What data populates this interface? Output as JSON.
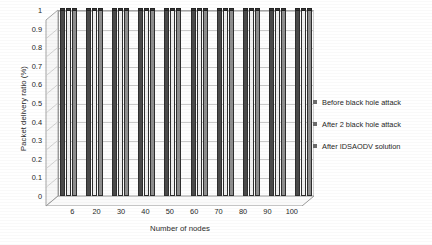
{
  "chart_data": {
    "type": "bar",
    "title": "",
    "subtitle": "",
    "xlabel": "Number of nodes",
    "ylabel": "Packet delivery ratio (%)",
    "categories": [
      "6",
      "20",
      "30",
      "40",
      "50",
      "60",
      "70",
      "80",
      "90",
      "100"
    ],
    "series": [
      {
        "name": "Before black hole attack",
        "values": [
          1,
          1,
          1,
          1,
          1,
          1,
          1,
          1,
          1,
          1
        ],
        "color": "#4a4a4a"
      },
      {
        "name": "After 2 black hole attack",
        "values": [
          1,
          1,
          1,
          1,
          1,
          1,
          1,
          1,
          1,
          1
        ],
        "color": "#efefef"
      },
      {
        "name": "After IDSAODV solution",
        "values": [
          1,
          1,
          1,
          1,
          1,
          1,
          1,
          1,
          1,
          1
        ],
        "color": "#8e8e8e"
      }
    ],
    "ylim": [
      0,
      1
    ],
    "yticks": [
      "0",
      "0.1",
      "0.2",
      "0.3",
      "0.4",
      "0.5",
      "0.6",
      "0.7",
      "0.8",
      "0.9",
      "1"
    ],
    "grid": true,
    "legend_position": "right",
    "projection": "3d"
  },
  "legend": {
    "items": [
      {
        "label": "Before black hole attack",
        "swatch": "#6d6d6d"
      },
      {
        "label": "After 2 black hole attack",
        "swatch": "#6d6d6d"
      },
      {
        "label": "After IDSAODV solution",
        "swatch": "#6d6d6d"
      }
    ]
  },
  "axes": {
    "y_title": "Packet delivery ratio (%)",
    "x_title": "Number of nodes"
  }
}
